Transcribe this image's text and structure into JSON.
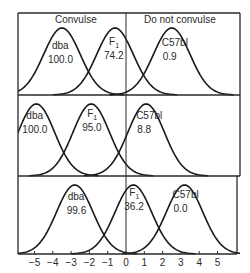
{
  "chart_data": {
    "type": "line",
    "title": "",
    "xlabel": "",
    "ylabel": "",
    "xlim": [
      -5.9,
      6.2
    ],
    "x_ticks": [
      -5,
      -4,
      -3,
      -2,
      -1,
      0,
      1,
      2,
      3,
      4,
      5
    ],
    "threshold_x": 0,
    "region_labels": {
      "left": "Convulse",
      "right": "Do not convulse"
    },
    "grid": false,
    "panels": [
      {
        "series": [
          {
            "name": "dba",
            "mean": -3.5,
            "sd": 1.0,
            "value_label": "100.0"
          },
          {
            "name": "F1",
            "mean": -0.6,
            "sd": 1.0,
            "value_label": "74.2"
          },
          {
            "name": "C57bl",
            "mean": 2.5,
            "sd": 1.0,
            "value_label": "0.9"
          }
        ]
      },
      {
        "series": [
          {
            "name": "dba",
            "mean": -4.9,
            "sd": 1.0,
            "value_label": "100.0"
          },
          {
            "name": "F1",
            "mean": -1.9,
            "sd": 1.0,
            "value_label": "95.0"
          },
          {
            "name": "C57bl",
            "mean": 1.1,
            "sd": 1.0,
            "value_label": "8.8"
          }
        ]
      },
      {
        "series": [
          {
            "name": "dba",
            "mean": -2.8,
            "sd": 1.0,
            "value_label": "99.6"
          },
          {
            "name": "F1",
            "mean": 0.4,
            "sd": 1.0,
            "value_label": "36.2"
          },
          {
            "name": "C57bl",
            "mean": 3.2,
            "sd": 1.0,
            "value_label": "0.0"
          }
        ]
      }
    ]
  },
  "labels": {
    "convulse": "Convulse",
    "do_not_convulse": "Do not convulse",
    "strain_dba": "dba",
    "strain_f1_main": "F",
    "strain_f1_sub": "1",
    "strain_c57": "C57bl"
  },
  "style": {
    "line_color": "#1a1a1a",
    "frame_color": "#2a2a2a",
    "text_color": "#2a2a2a"
  }
}
